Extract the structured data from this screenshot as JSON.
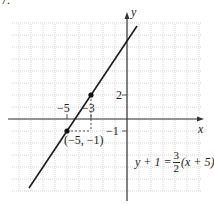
{
  "problem_number": "7.",
  "axes": {
    "x_label": "x",
    "y_label": "y"
  },
  "tick_labels": {
    "x_neg5": "−5",
    "x_neg3": "−3",
    "y_2": "2",
    "y_neg1": "−1"
  },
  "points": [
    {
      "label": "(−5, −1)",
      "x": -5,
      "y": -1
    },
    {
      "label": "",
      "x": -3,
      "y": 2
    }
  ],
  "equation": {
    "lhs": "y + 1 =",
    "num": "3",
    "den": "2",
    "rhs": "(x + 5)"
  },
  "line": {
    "slope": 1.5,
    "y_intercept": 6.5
  },
  "grid": {
    "unit_px": 12,
    "origin_px": [
      127,
      119
    ],
    "x_range": [
      -9,
      6
    ],
    "y_range": [
      -6,
      8
    ]
  },
  "colors": {
    "line": "#1a1a1a",
    "grid": "#c8c8c8",
    "axis": "#333333",
    "text": "#222222"
  }
}
